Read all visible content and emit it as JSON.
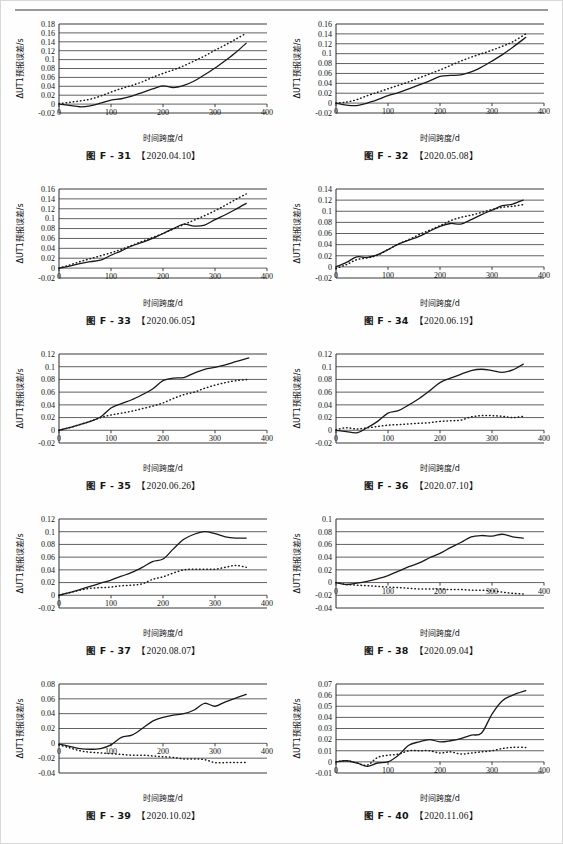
{
  "page": {
    "header_rule": true,
    "header_text": "",
    "background": "#fefefe"
  },
  "common": {
    "ylabel": "ΔUT1预报误差/s",
    "xlabel": "时间跨度/d",
    "caption_prefix": "图",
    "series_solid": "solid-line-series",
    "series_dotted": "dotted-line-series",
    "line_color": "#1a1a1a",
    "grid_color": "#3a3a3a"
  },
  "chart_data": [
    {
      "id": "F-31",
      "type": "line",
      "title": "图 F - 31",
      "date": "【2020.04.10】",
      "xlabel": "时间跨度/d",
      "ylabel": "ΔUT1预报误差/s",
      "xlim": [
        0,
        400
      ],
      "ylim": [
        -0.02,
        0.18
      ],
      "xticks": [
        0,
        100,
        200,
        300,
        400
      ],
      "yticks": [
        -0.02,
        0,
        0.02,
        0.04,
        0.06,
        0.08,
        0.1,
        0.12,
        0.14,
        0.16,
        0.18
      ],
      "grid": true,
      "x": [
        0,
        20,
        40,
        60,
        80,
        100,
        120,
        140,
        160,
        180,
        200,
        220,
        240,
        260,
        280,
        300,
        320,
        340,
        360
      ],
      "series": [
        {
          "name": "solid",
          "style": "solid",
          "values": [
            0.0,
            -0.003,
            -0.006,
            -0.004,
            0.002,
            0.009,
            0.012,
            0.018,
            0.026,
            0.034,
            0.041,
            0.037,
            0.042,
            0.052,
            0.066,
            0.081,
            0.098,
            0.116,
            0.137
          ]
        },
        {
          "name": "dotted",
          "style": "dotted",
          "values": [
            0.001,
            0.004,
            0.007,
            0.011,
            0.018,
            0.027,
            0.035,
            0.042,
            0.05,
            0.06,
            0.069,
            0.077,
            0.086,
            0.097,
            0.108,
            0.121,
            0.133,
            0.146,
            0.159
          ]
        }
      ]
    },
    {
      "id": "F-32",
      "type": "line",
      "title": "图 F - 32",
      "date": "【2020.05.08】",
      "xlabel": "时间跨度/d",
      "ylabel": "ΔUT1预报误差/s",
      "xlim": [
        0,
        400
      ],
      "ylim": [
        -0.02,
        0.16
      ],
      "xticks": [
        0,
        100,
        200,
        300,
        400
      ],
      "yticks": [
        -0.02,
        0,
        0.02,
        0.04,
        0.06,
        0.08,
        0.1,
        0.12,
        0.14,
        0.16
      ],
      "grid": true,
      "x": [
        0,
        20,
        40,
        60,
        80,
        100,
        120,
        140,
        160,
        180,
        200,
        220,
        240,
        260,
        280,
        300,
        320,
        340,
        365
      ],
      "series": [
        {
          "name": "solid",
          "style": "solid",
          "values": [
            0.0,
            -0.004,
            -0.005,
            0.0,
            0.007,
            0.015,
            0.021,
            0.029,
            0.037,
            0.045,
            0.054,
            0.056,
            0.057,
            0.063,
            0.073,
            0.085,
            0.098,
            0.113,
            0.133
          ]
        },
        {
          "name": "dotted",
          "style": "dotted",
          "values": [
            0.0,
            0.002,
            0.007,
            0.015,
            0.022,
            0.029,
            0.036,
            0.043,
            0.051,
            0.059,
            0.067,
            0.076,
            0.085,
            0.093,
            0.1,
            0.107,
            0.115,
            0.124,
            0.14
          ]
        }
      ]
    },
    {
      "id": "F-33",
      "type": "line",
      "title": "图 F - 33",
      "date": "【2020.06.05】",
      "xlabel": "时间跨度/d",
      "ylabel": "ΔUT1预报误差/s",
      "xlim": [
        0,
        400
      ],
      "ylim": [
        -0.02,
        0.16
      ],
      "xticks": [
        0,
        100,
        200,
        300,
        400
      ],
      "yticks": [
        -0.02,
        0,
        0.02,
        0.04,
        0.06,
        0.08,
        0.1,
        0.12,
        0.14,
        0.16
      ],
      "grid": true,
      "x": [
        0,
        20,
        40,
        60,
        80,
        100,
        120,
        140,
        160,
        180,
        200,
        220,
        240,
        260,
        280,
        300,
        320,
        340,
        360
      ],
      "series": [
        {
          "name": "solid",
          "style": "solid",
          "values": [
            0.0,
            0.004,
            0.009,
            0.013,
            0.016,
            0.026,
            0.035,
            0.045,
            0.052,
            0.06,
            0.07,
            0.08,
            0.089,
            0.085,
            0.087,
            0.098,
            0.108,
            0.119,
            0.131
          ]
        },
        {
          "name": "dotted",
          "style": "dotted",
          "values": [
            0.0,
            0.006,
            0.013,
            0.019,
            0.025,
            0.031,
            0.038,
            0.046,
            0.054,
            0.062,
            0.07,
            0.079,
            0.088,
            0.097,
            0.106,
            0.116,
            0.127,
            0.139,
            0.15
          ]
        }
      ]
    },
    {
      "id": "F-34",
      "type": "line",
      "title": "图 F - 34",
      "date": "【2020.06.19】",
      "xlabel": "时间跨度/d",
      "ylabel": "ΔUT1预报误差/s",
      "xlim": [
        0,
        400
      ],
      "ylim": [
        -0.02,
        0.14
      ],
      "xticks": [
        0,
        100,
        200,
        300,
        400
      ],
      "yticks": [
        -0.02,
        0,
        0.02,
        0.04,
        0.06,
        0.08,
        0.1,
        0.12,
        0.14
      ],
      "grid": true,
      "x": [
        0,
        20,
        40,
        60,
        80,
        100,
        120,
        140,
        160,
        180,
        200,
        220,
        240,
        260,
        280,
        300,
        320,
        340,
        360
      ],
      "series": [
        {
          "name": "solid",
          "style": "solid",
          "values": [
            0.0,
            0.008,
            0.018,
            0.017,
            0.022,
            0.031,
            0.041,
            0.048,
            0.055,
            0.064,
            0.073,
            0.078,
            0.077,
            0.085,
            0.094,
            0.102,
            0.11,
            0.113,
            0.12
          ]
        },
        {
          "name": "dotted",
          "style": "dotted",
          "values": [
            -0.003,
            0.004,
            0.013,
            0.016,
            0.021,
            0.031,
            0.041,
            0.049,
            0.058,
            0.066,
            0.074,
            0.083,
            0.089,
            0.093,
            0.098,
            0.103,
            0.107,
            0.109,
            0.112
          ]
        }
      ]
    },
    {
      "id": "F-35",
      "type": "line",
      "title": "图 F - 35",
      "date": "【2020.06.26】",
      "xlabel": "时间跨度/d",
      "ylabel": "ΔUT1预报误差/s",
      "xlim": [
        0,
        400
      ],
      "ylim": [
        -0.02,
        0.12
      ],
      "xticks": [
        0,
        100,
        200,
        300,
        400
      ],
      "yticks": [
        -0.02,
        0,
        0.02,
        0.04,
        0.06,
        0.08,
        0.1,
        0.12
      ],
      "grid": true,
      "x": [
        0,
        20,
        40,
        60,
        80,
        100,
        120,
        140,
        160,
        180,
        200,
        220,
        240,
        260,
        280,
        300,
        320,
        340,
        365
      ],
      "series": [
        {
          "name": "solid",
          "style": "solid",
          "values": [
            0.0,
            0.004,
            0.009,
            0.014,
            0.021,
            0.035,
            0.042,
            0.048,
            0.056,
            0.065,
            0.078,
            0.082,
            0.083,
            0.09,
            0.096,
            0.099,
            0.103,
            0.108,
            0.114
          ]
        },
        {
          "name": "dotted",
          "style": "dotted",
          "values": [
            0.0,
            0.004,
            0.009,
            0.014,
            0.02,
            0.024,
            0.027,
            0.03,
            0.034,
            0.038,
            0.043,
            0.05,
            0.056,
            0.06,
            0.066,
            0.071,
            0.075,
            0.078,
            0.08
          ]
        }
      ]
    },
    {
      "id": "F-36",
      "type": "line",
      "title": "图 F - 36",
      "date": "【2020.07.10】",
      "xlabel": "时间跨度/d",
      "ylabel": "ΔUT1预报误差/s",
      "xlim": [
        0,
        400
      ],
      "ylim": [
        -0.02,
        0.12
      ],
      "xticks": [
        0,
        100,
        200,
        300,
        400
      ],
      "yticks": [
        -0.02,
        0,
        0.02,
        0.04,
        0.06,
        0.08,
        0.1,
        0.12
      ],
      "grid": true,
      "x": [
        0,
        20,
        40,
        60,
        80,
        100,
        120,
        140,
        160,
        180,
        200,
        220,
        240,
        260,
        280,
        300,
        320,
        340,
        360
      ],
      "series": [
        {
          "name": "solid",
          "style": "solid",
          "values": [
            0.0,
            -0.002,
            -0.004,
            0.004,
            0.014,
            0.027,
            0.031,
            0.04,
            0.05,
            0.062,
            0.075,
            0.082,
            0.088,
            0.094,
            0.096,
            0.094,
            0.091,
            0.095,
            0.104
          ]
        },
        {
          "name": "dotted",
          "style": "dotted",
          "values": [
            0.001,
            0.004,
            0.002,
            0.004,
            0.006,
            0.008,
            0.009,
            0.01,
            0.011,
            0.012,
            0.014,
            0.015,
            0.016,
            0.021,
            0.023,
            0.023,
            0.022,
            0.02,
            0.022
          ]
        }
      ]
    },
    {
      "id": "F-37",
      "type": "line",
      "title": "图 F - 37",
      "date": "【2020.08.07】",
      "xlabel": "时间跨度/d",
      "ylabel": "ΔUT1预报误差/s",
      "xlim": [
        0,
        400
      ],
      "ylim": [
        -0.02,
        0.12
      ],
      "xticks": [
        0,
        100,
        200,
        300,
        400
      ],
      "yticks": [
        -0.02,
        0,
        0.02,
        0.04,
        0.06,
        0.08,
        0.1,
        0.12
      ],
      "grid": true,
      "x": [
        0,
        20,
        40,
        60,
        80,
        100,
        120,
        140,
        160,
        180,
        200,
        220,
        240,
        260,
        280,
        300,
        320,
        340,
        360
      ],
      "series": [
        {
          "name": "solid",
          "style": "solid",
          "values": [
            0.0,
            0.004,
            0.009,
            0.014,
            0.019,
            0.024,
            0.03,
            0.036,
            0.044,
            0.053,
            0.057,
            0.073,
            0.088,
            0.096,
            0.1,
            0.097,
            0.092,
            0.09,
            0.09
          ]
        },
        {
          "name": "dotted",
          "style": "dotted",
          "values": [
            0.0,
            0.004,
            0.008,
            0.011,
            0.012,
            0.013,
            0.015,
            0.016,
            0.018,
            0.025,
            0.029,
            0.035,
            0.04,
            0.041,
            0.041,
            0.041,
            0.044,
            0.047,
            0.044
          ]
        }
      ]
    },
    {
      "id": "F-38",
      "type": "line",
      "title": "图 F - 38",
      "date": "【2020.09.04】",
      "xlabel": "时间跨度/d",
      "ylabel": "ΔUT1预报误差/s",
      "xlim": [
        0,
        400
      ],
      "ylim": [
        -0.04,
        0.1
      ],
      "xticks": [
        0,
        100,
        200,
        300,
        400
      ],
      "yticks": [
        -0.04,
        -0.02,
        0,
        0.02,
        0.04,
        0.06,
        0.08,
        0.1
      ],
      "grid": true,
      "x": [
        0,
        20,
        40,
        60,
        80,
        100,
        120,
        140,
        160,
        180,
        200,
        220,
        240,
        260,
        280,
        300,
        320,
        340,
        360
      ],
      "series": [
        {
          "name": "solid",
          "style": "solid",
          "values": [
            0.0,
            -0.003,
            -0.001,
            0.002,
            0.006,
            0.011,
            0.018,
            0.025,
            0.031,
            0.039,
            0.046,
            0.055,
            0.063,
            0.072,
            0.074,
            0.073,
            0.076,
            0.072,
            0.07
          ]
        },
        {
          "name": "dotted",
          "style": "dotted",
          "values": [
            0.0,
            -0.003,
            -0.004,
            -0.005,
            -0.006,
            -0.007,
            -0.008,
            -0.009,
            -0.01,
            -0.01,
            -0.01,
            -0.011,
            -0.011,
            -0.012,
            -0.012,
            -0.013,
            -0.015,
            -0.017,
            -0.018
          ]
        }
      ]
    },
    {
      "id": "F-39",
      "type": "line",
      "title": "图 F - 39",
      "date": "【2020.10.02】",
      "xlabel": "时间跨度/d",
      "ylabel": "ΔUT1预报误差/s",
      "xlim": [
        0,
        400
      ],
      "ylim": [
        -0.04,
        0.08
      ],
      "xticks": [
        0,
        100,
        200,
        300,
        400
      ],
      "yticks": [
        -0.04,
        -0.02,
        0,
        0.02,
        0.04,
        0.06,
        0.08
      ],
      "grid": true,
      "x": [
        0,
        20,
        40,
        60,
        80,
        100,
        120,
        140,
        160,
        180,
        200,
        220,
        240,
        260,
        280,
        300,
        320,
        340,
        360
      ],
      "series": [
        {
          "name": "solid",
          "style": "solid",
          "values": [
            -0.001,
            -0.004,
            -0.007,
            -0.008,
            -0.007,
            -0.002,
            0.008,
            0.011,
            0.02,
            0.03,
            0.035,
            0.038,
            0.04,
            0.045,
            0.054,
            0.05,
            0.056,
            0.061,
            0.066
          ]
        },
        {
          "name": "dotted",
          "style": "dotted",
          "values": [
            -0.002,
            -0.006,
            -0.01,
            -0.012,
            -0.013,
            -0.014,
            -0.015,
            -0.016,
            -0.016,
            -0.017,
            -0.018,
            -0.019,
            -0.021,
            -0.021,
            -0.022,
            -0.026,
            -0.026,
            -0.026,
            -0.026
          ]
        }
      ]
    },
    {
      "id": "F-40",
      "type": "line",
      "title": "图 F - 40",
      "date": "【2020.11.06】",
      "xlabel": "时间跨度/d",
      "ylabel": "ΔUT1预报误差/s",
      "xlim": [
        0,
        400
      ],
      "ylim": [
        -0.01,
        0.07
      ],
      "xticks": [
        0,
        100,
        200,
        300,
        400
      ],
      "yticks": [
        -0.01,
        0,
        0.01,
        0.02,
        0.03,
        0.04,
        0.05,
        0.06,
        0.07
      ],
      "grid": true,
      "x": [
        0,
        20,
        40,
        60,
        80,
        100,
        120,
        140,
        160,
        180,
        200,
        220,
        240,
        260,
        280,
        300,
        320,
        340,
        365
      ],
      "series": [
        {
          "name": "solid",
          "style": "solid",
          "values": [
            0.0,
            0.001,
            -0.001,
            -0.004,
            -0.001,
            0.0,
            0.006,
            0.015,
            0.018,
            0.02,
            0.018,
            0.019,
            0.021,
            0.024,
            0.026,
            0.043,
            0.055,
            0.06,
            0.064
          ]
        },
        {
          "name": "dotted",
          "style": "dotted",
          "values": [
            0.0,
            0.001,
            -0.001,
            -0.003,
            0.004,
            0.006,
            0.007,
            0.01,
            0.01,
            0.01,
            0.008,
            0.009,
            0.007,
            0.008,
            0.009,
            0.01,
            0.012,
            0.013,
            0.013
          ]
        }
      ]
    }
  ]
}
